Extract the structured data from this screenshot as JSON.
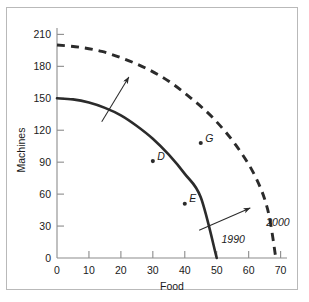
{
  "figure": {
    "background_color": "#ffffff",
    "frame_color": "#b9b9b9",
    "ink_color": "#2b2b2b"
  },
  "chart_data": {
    "type": "line",
    "title": "",
    "xlabel": "Food",
    "ylabel": "Machines",
    "xlim": [
      0,
      72
    ],
    "ylim": [
      0,
      216
    ],
    "xticks": [
      0,
      10,
      20,
      30,
      40,
      50,
      60,
      70
    ],
    "yticks": [
      0,
      30,
      60,
      90,
      120,
      150,
      180,
      210
    ],
    "xtick_labels": [
      "0",
      "10",
      "20",
      "30",
      "40",
      "50",
      "60",
      "70"
    ],
    "ytick_labels": [
      "0",
      "30",
      "60",
      "90",
      "120",
      "150",
      "180",
      "210"
    ],
    "grid": false,
    "legend": "none",
    "series": [
      {
        "name": "1990",
        "style": "solid",
        "label": "1990",
        "label_x": 51.5,
        "label_y": 14,
        "points": [
          [
            0,
            150
          ],
          [
            5,
            149
          ],
          [
            10,
            146
          ],
          [
            15,
            141
          ],
          [
            20,
            134
          ],
          [
            25,
            124
          ],
          [
            30,
            112
          ],
          [
            35,
            97
          ],
          [
            40,
            79
          ],
          [
            45,
            57
          ],
          [
            50,
            0
          ]
        ],
        "endpoints": {
          "y_intercept": 150,
          "x_intercept": 50
        }
      },
      {
        "name": "2000",
        "style": "dashed",
        "label": "2000",
        "label_x": 65.5,
        "label_y": 30,
        "points": [
          [
            0,
            200
          ],
          [
            7,
            198
          ],
          [
            14,
            194
          ],
          [
            21,
            187
          ],
          [
            28,
            178
          ],
          [
            35,
            166
          ],
          [
            42,
            150
          ],
          [
            49,
            131
          ],
          [
            56,
            106
          ],
          [
            62,
            77
          ],
          [
            66,
            45
          ],
          [
            68.5,
            0
          ]
        ],
        "endpoints": {
          "y_intercept": 200,
          "x_intercept": 68.5
        }
      }
    ],
    "data_points": [
      {
        "label": "D",
        "x": 30,
        "y": 91,
        "on_series": "1990"
      },
      {
        "label": "E",
        "x": 40,
        "y": 51,
        "on_series": "1990"
      },
      {
        "label": "G",
        "x": 45,
        "y": 108,
        "on_series": "2000"
      }
    ],
    "annotations": [
      {
        "type": "arrow",
        "name": "shift-arrow-upper",
        "from_x": 14,
        "from_y": 128,
        "to_x": 22.5,
        "to_y": 170
      },
      {
        "type": "arrow",
        "name": "shift-arrow-lower",
        "from_x": 44.5,
        "from_y": 26,
        "to_x": 60.5,
        "to_y": 47
      }
    ]
  }
}
